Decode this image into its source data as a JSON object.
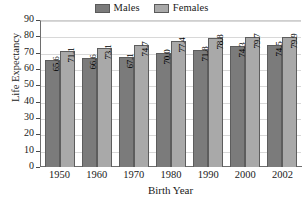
{
  "chart_data": {
    "type": "bar",
    "title": "",
    "xlabel": "Birth Year",
    "ylabel": "Life Expectancy",
    "categories": [
      "1950",
      "1960",
      "1970",
      "1980",
      "1990",
      "2000",
      "2002"
    ],
    "series": [
      {
        "name": "Males",
        "color": "#7b7b7b",
        "values": [
          65.6,
          66.6,
          67.1,
          70.0,
          71.8,
          74.3,
          74.5
        ],
        "labels": [
          "65.6",
          "66.6",
          "67.1",
          "70.0",
          "71.8",
          "74.3",
          "74.5"
        ]
      },
      {
        "name": "Females",
        "color": "#a9a9a9",
        "values": [
          71.1,
          73.1,
          74.7,
          77.4,
          78.8,
          79.7,
          79.9
        ],
        "labels": [
          "71.1",
          "73.1",
          "74.7",
          "77.4",
          "78.8",
          "79.7",
          "79.9"
        ]
      }
    ],
    "ylim": [
      0,
      90
    ],
    "yticks": [
      0,
      10,
      20,
      30,
      40,
      50,
      60,
      70,
      80,
      90
    ],
    "ytick_labels": [
      "0",
      "10",
      "20",
      "30",
      "40",
      "50",
      "60",
      "70",
      "80",
      "90"
    ],
    "grid": true,
    "legend_position": "top-center",
    "bar_value_labels": true
  },
  "legend": {
    "entries": [
      {
        "label": "Males",
        "color": "#7b7b7b"
      },
      {
        "label": "Females",
        "color": "#a9a9a9"
      }
    ]
  },
  "axes": {
    "y_title": "Life Expectancy",
    "x_title": "Birth Year"
  }
}
